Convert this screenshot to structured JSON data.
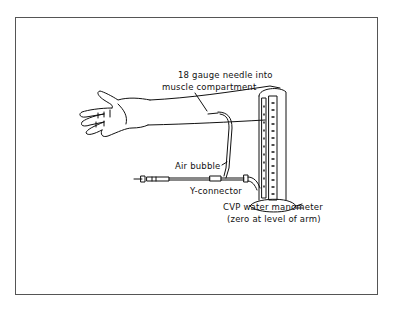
{
  "diagram": {
    "labels": {
      "needle_line1": "18 gauge needle into",
      "needle_line2": "muscle compartment",
      "air_bubble": "Air bubble",
      "y_connector": "Y-connector",
      "manometer_line1": "CVP water manometer",
      "manometer_line2": "(zero at level of arm)"
    },
    "components": [
      "arm",
      "hand",
      "18 gauge needle",
      "tubing",
      "air bubble",
      "Y-connector",
      "syringe",
      "CVP water manometer"
    ]
  }
}
